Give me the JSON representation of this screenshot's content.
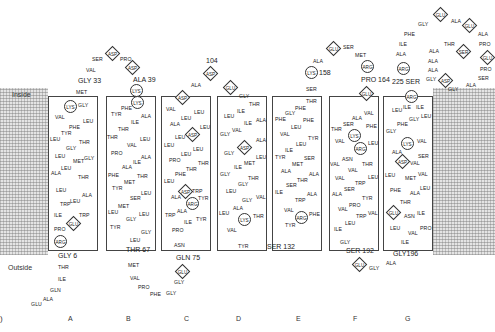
{
  "figure": {
    "panel_label": ")",
    "side_labels": {
      "inside": "Inside",
      "outside": "Outside"
    },
    "helix_labels": [
      "A",
      "B",
      "C",
      "D",
      "E",
      "F",
      "G"
    ],
    "numbers": {
      "n6": "GLY 6",
      "n33": "GLY 33",
      "n39": "ALA 39",
      "n67": "THR 67",
      "n75": "GLN 75",
      "n104": "104",
      "n132": "SER 132",
      "n158": "158",
      "n164": "PRO 164",
      "n192": "SER 192",
      "n196": "GLY196",
      "n225": "225 SER"
    },
    "helices": {
      "A": [
        "LYS",
        "GLY",
        "VAL",
        "LEU",
        "PHE",
        "TYR",
        "LEU",
        "THR",
        "GLY",
        "LEU",
        "GLY",
        "MET",
        "ALA",
        "LEU",
        "THR",
        "LEU",
        "ALA",
        "TRP",
        "LEU",
        "ILE",
        "TRP",
        "GLU",
        "PRO"
      ],
      "B": [
        "LYS",
        "PHE",
        "TYR",
        "ALA",
        "ILE",
        "THR",
        "THR",
        "LEU",
        "VAL",
        "PRO",
        "ALA",
        "ILE",
        "ALA",
        "PHE",
        "THR",
        "MET",
        "TYR",
        "LEU",
        "SER",
        "MET",
        "LEU",
        "LEU",
        "GLY",
        "TYR",
        "GLY"
      ],
      "C": [
        "ASP",
        "VAL",
        "LEU",
        "LEU",
        "ALA",
        "LEU",
        "ASP",
        "LEU",
        "LEU",
        "LEU",
        "LEU",
        "PRO",
        "THR",
        "THR",
        "PHE",
        "LEU",
        "TRP",
        "ASP",
        "ALA",
        "ARG",
        "TYR",
        "TRP",
        "ALA",
        "TYR",
        "ILE",
        "PRO"
      ],
      "D": [
        "THR",
        "ILE",
        "LEU",
        "ILE",
        "ALA",
        "GLY",
        "VAL",
        "ALA",
        "ASP",
        "GLY",
        "LEU",
        "MET",
        "ILE",
        "GLY",
        "THR",
        "GLY",
        "LEU",
        "GLY",
        "VAL",
        "ALA",
        "LEU",
        "LYS",
        "THR",
        "VAL"
      ],
      "E": [
        "THR",
        "PHE",
        "PHE",
        "GLY",
        "PHE",
        "PHE",
        "LEU",
        "VAL",
        "TYR",
        "LEU",
        "ILE",
        "TYR",
        "SER",
        "MET",
        "ALA",
        "ALA",
        "THR",
        "SER",
        "ILE",
        "ALA",
        "TRP",
        "VAL",
        "ARG",
        "PHE",
        "TYR"
      ],
      "F": [
        "GLU",
        "VAL",
        "ALA",
        "SER",
        "THR",
        "PHE",
        "LYS",
        "VAL",
        "LEU",
        "ARG",
        "ASN",
        "VAL",
        "THR",
        "VAL",
        "LEU",
        "VAL",
        "TRP",
        "SER",
        "ALA",
        "TYR",
        "PRO",
        "VAL",
        "TRP",
        "VAL",
        "LEU",
        "ILE"
      ],
      "G": [
        "ARG",
        "ILE",
        "LEU",
        "ILE",
        "GLY",
        "LEU",
        "PHE",
        "GLY",
        "LYS",
        "VAL",
        "ALA",
        "SER",
        "ASP",
        "VAL",
        "LEU",
        "MET",
        "VAL",
        "PHE",
        "LEU",
        "ALA",
        "THR",
        "GLU",
        "ASN",
        "ILE",
        "LEU",
        "PRO",
        "VAL",
        "ILE"
      ]
    },
    "loops": {
      "n_term": [
        "ARG",
        "GLY",
        "THR",
        "ILE",
        "GLN",
        "ALA",
        "GLU"
      ],
      "AB": [
        "MET",
        "GLY",
        "VAL",
        "SER",
        "ASP",
        "PRO",
        "ASP",
        "ALA",
        "LYS"
      ],
      "BC": [
        "LEU",
        "THR",
        "MET",
        "VAL",
        "PRO",
        "PHE",
        "GLY",
        "GLY",
        "GLU",
        "GLN",
        "ASN"
      ],
      "CD": [
        "ASP",
        "ALA",
        "ASP",
        "GLU",
        "GLY"
      ],
      "DE": [
        "TYR",
        "SER"
      ],
      "EF": [
        "SER",
        "LYS",
        "ALA",
        "GLU",
        "SER",
        "MET",
        "ARG",
        "PRO",
        "GLU"
      ],
      "FG": [
        "GLY",
        "SER",
        "GLU",
        "GLY",
        "ALA",
        "GLY"
      ],
      "c_term": [
        "ARG",
        "SER",
        "ARG",
        "ALA",
        "ILE",
        "PHE",
        "GLY",
        "GLU",
        "ALA",
        "GLU",
        "ALA",
        "PRO",
        "GLU",
        "PRO",
        "SER",
        "ALA",
        "GLY",
        "ASP",
        "GLY",
        "ALA",
        "ALA",
        "ALA",
        "THR",
        "SER"
      ]
    }
  }
}
